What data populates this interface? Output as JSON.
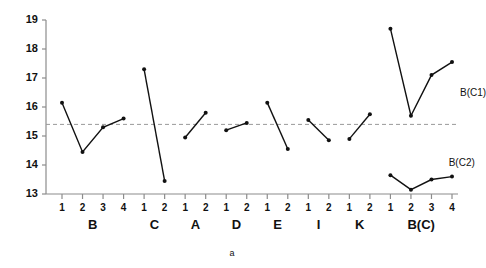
{
  "chart_data": {
    "type": "line",
    "title": "",
    "caption": "a",
    "xlabel": "",
    "ylabel": "",
    "ylim": [
      13,
      19
    ],
    "yticks": [
      13,
      14,
      15,
      16,
      17,
      18,
      19
    ],
    "ytick_labels": [
      "13",
      "14",
      "15",
      "16",
      "17",
      "18",
      "19"
    ],
    "grid": false,
    "legend": "none",
    "reference_line": {
      "value": 15.4,
      "style": "dashed",
      "color": "#9a9a9a"
    },
    "annotations": [
      {
        "text": "B(C1)",
        "x": 4.0,
        "y": 16.45
      },
      {
        "text": "B(C2)",
        "x": 3.45,
        "y": 14.05
      }
    ],
    "groups": [
      {
        "label": "B",
        "xtick_labels": [
          "1",
          "2",
          "3",
          "4"
        ],
        "values": [
          16.15,
          14.45,
          15.3,
          15.6
        ]
      },
      {
        "label": "C",
        "xtick_labels": [
          "1",
          "2"
        ],
        "values": [
          17.3,
          13.45
        ]
      },
      {
        "label": "A",
        "xtick_labels": [
          "1",
          "2"
        ],
        "values": [
          14.95,
          15.8
        ]
      },
      {
        "label": "D",
        "xtick_labels": [
          "1",
          "2"
        ],
        "values": [
          15.2,
          15.45
        ]
      },
      {
        "label": "E",
        "xtick_labels": [
          "1",
          "2"
        ],
        "values": [
          16.15,
          14.55
        ]
      },
      {
        "label": "I",
        "xtick_labels": [
          "1",
          "2"
        ],
        "values": [
          15.55,
          14.85
        ]
      },
      {
        "label": "K",
        "xtick_labels": [
          "1",
          "2"
        ],
        "values": [
          14.9,
          15.75
        ]
      },
      {
        "label": "B(C)",
        "xtick_labels": [
          "1",
          "2",
          "3",
          "4"
        ],
        "series": [
          {
            "name": "B(C1)",
            "values": [
              18.7,
              15.7,
              17.1,
              17.55
            ]
          },
          {
            "name": "B(C2)",
            "values": [
              13.65,
              13.15,
              13.5,
              13.6
            ]
          }
        ]
      }
    ],
    "colors": {
      "line": "#111111",
      "marker": "#111111",
      "axis": "#8c8c8c",
      "reference": "#9a9a9a",
      "text": "#111111",
      "background": "#ffffff"
    }
  }
}
